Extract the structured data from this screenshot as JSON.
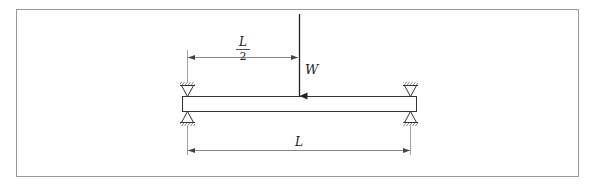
{
  "diagram": {
    "type": "simply-supported-beam-point-load",
    "labels": {
      "load": "W",
      "half_span_numerator": "L",
      "half_span_denominator": "2",
      "span": "L"
    },
    "colors": {
      "frame": "#9a9a9a",
      "stroke": "#333333",
      "dimension": "#777777",
      "background": "#ffffff"
    }
  }
}
